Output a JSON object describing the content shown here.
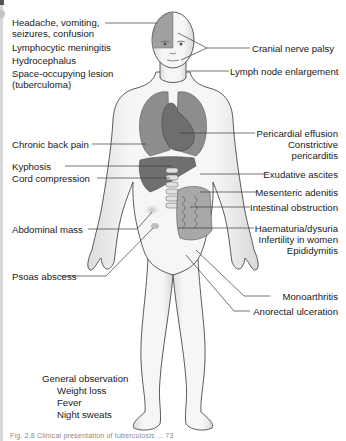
{
  "figure": {
    "colors": {
      "skin": "#f1f1f1",
      "outline": "#4a4a4a",
      "organ": "#8a8a8a",
      "organ_dark": "#6c6c6c",
      "brain_patch": "#9a9a9a",
      "leader_line": "#3a3a3a",
      "lesion": "#c9c9c9"
    },
    "left_labels": [
      {
        "id": "headache",
        "lines": [
          "Headache, vomiting,",
          "seizures, confusion"
        ]
      },
      {
        "id": "meningitis",
        "lines": [
          "Lymphocytic meningitis"
        ]
      },
      {
        "id": "hydrocephalus",
        "lines": [
          "Hydrocephalus"
        ]
      },
      {
        "id": "space-occupying",
        "lines": [
          "Space-occupying lesion",
          "(tuberculoma)"
        ]
      },
      {
        "id": "back-pain",
        "lines": [
          "Chronic back pain"
        ]
      },
      {
        "id": "kyphosis",
        "lines": [
          "Kyphosis"
        ]
      },
      {
        "id": "cord-compression",
        "lines": [
          "Cord compression"
        ]
      },
      {
        "id": "abdominal-mass",
        "lines": [
          "Abdominal mass"
        ]
      },
      {
        "id": "psoas-abscess",
        "lines": [
          "Psoas abscess"
        ]
      }
    ],
    "right_labels": [
      {
        "id": "cranial-nerve",
        "lines": [
          "Cranial nerve palsy"
        ]
      },
      {
        "id": "lymph-node",
        "lines": [
          "Lymph node enlargement"
        ]
      },
      {
        "id": "pericardial",
        "lines": [
          "Pericardial effusion",
          "Constrictive",
          "pericarditis"
        ]
      },
      {
        "id": "ascites",
        "lines": [
          "Exudative ascites"
        ]
      },
      {
        "id": "mesenteric",
        "lines": [
          "Mesenteric adenitis"
        ]
      },
      {
        "id": "intestinal",
        "lines": [
          "Intestinal obstruction"
        ]
      },
      {
        "id": "haematuria",
        "lines": [
          "Haematuria/dysuria",
          "Infertility in women",
          "Epididymitis"
        ]
      },
      {
        "id": "monoarthritis",
        "lines": [
          "Monoarthritis"
        ]
      },
      {
        "id": "anorectal",
        "lines": [
          "Anorectal ulceration"
        ]
      }
    ],
    "general": {
      "title": "General observation",
      "items": [
        "Weight loss",
        "Fever",
        "Night sweats"
      ]
    },
    "caption": "Fig. 2.8 Clinical presentation of tuberculosis ... 73"
  }
}
